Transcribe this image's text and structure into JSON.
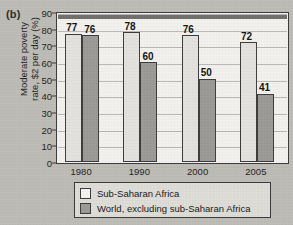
{
  "panel": {
    "label": "(b)"
  },
  "chart_data": {
    "type": "bar",
    "title": "",
    "xlabel": "",
    "ylabel": "Moderate poverty\nrate, $2 per day (%)",
    "ylim": [
      0,
      90
    ],
    "ytick_step": 10,
    "yticks": [
      "0",
      "10",
      "20",
      "30",
      "40",
      "50",
      "60",
      "70",
      "80",
      "90"
    ],
    "categories": [
      "1980",
      "1990",
      "2000",
      "2005"
    ],
    "grid": "horizontal",
    "legend_position": "bottom",
    "series": [
      {
        "name": "Sub-Saharan Africa",
        "color": "#e3e2de",
        "values": [
          77,
          78,
          76,
          72
        ],
        "labels": [
          "77",
          "78",
          "76",
          "72"
        ]
      },
      {
        "name": "World, excluding sub-Saharan Africa",
        "color": "#9a9995",
        "values": [
          76,
          60,
          50,
          41
        ],
        "labels": [
          "76",
          "60",
          "50",
          "41"
        ]
      }
    ]
  },
  "legend": {
    "items": [
      {
        "label": "Sub-Saharan Africa",
        "swatch": "light"
      },
      {
        "label": "World, excluding sub-Saharan Africa",
        "swatch": "dark"
      }
    ]
  }
}
